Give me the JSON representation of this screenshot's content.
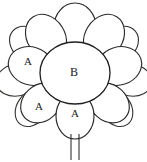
{
  "figure": {
    "kind": "flower-line-drawing",
    "background_color": "#ffffff",
    "line_color": "#2b2b2b",
    "width": 147,
    "height": 162,
    "core": {
      "label": "B",
      "cx": 75,
      "cy": 73,
      "rx": 35,
      "ry": 31
    },
    "labels": [
      {
        "id": "petal-label-left",
        "text": "A",
        "x": 28,
        "y": 62
      },
      {
        "id": "petal-label-lower-left",
        "text": "A",
        "x": 39,
        "y": 107
      },
      {
        "id": "petal-label-bottom",
        "text": "A",
        "x": 75,
        "y": 114
      },
      {
        "id": "core-label",
        "text": "B",
        "x": 74,
        "y": 73
      }
    ],
    "inner_petals": [
      {
        "id": "inner-petal-top",
        "cx": 75,
        "cy": 26,
        "rx": 21,
        "ry": 24,
        "rot": 0
      },
      {
        "id": "inner-petal-upper-left",
        "cx": 45,
        "cy": 35,
        "rx": 19,
        "ry": 24,
        "rot": -32
      },
      {
        "id": "inner-petal-upper-right",
        "cx": 105,
        "cy": 35,
        "rx": 19,
        "ry": 24,
        "rot": 32
      },
      {
        "id": "inner-petal-left",
        "cx": 30,
        "cy": 65,
        "rx": 19,
        "ry": 23,
        "rot": -72
      },
      {
        "id": "inner-petal-right",
        "cx": 120,
        "cy": 65,
        "rx": 19,
        "ry": 23,
        "rot": 72
      },
      {
        "id": "inner-petal-lower-left",
        "cx": 40,
        "cy": 104,
        "rx": 18,
        "ry": 22,
        "rot": -132
      },
      {
        "id": "inner-petal-lower-right",
        "cx": 110,
        "cy": 104,
        "rx": 18,
        "ry": 22,
        "rot": 132
      },
      {
        "id": "inner-petal-bottom",
        "cx": 75,
        "cy": 116,
        "rx": 19,
        "ry": 23,
        "rot": 180
      }
    ],
    "outer_petals": [
      {
        "id": "outer-petal-upper-left",
        "cx": 28,
        "cy": 42,
        "rx": 16,
        "ry": 20,
        "rot": -50
      },
      {
        "id": "outer-petal-upper-right",
        "cx": 122,
        "cy": 42,
        "rx": 16,
        "ry": 20,
        "rot": 50
      },
      {
        "id": "outer-petal-mid-left",
        "cx": 17,
        "cy": 80,
        "rx": 16,
        "ry": 21,
        "rot": -100
      },
      {
        "id": "outer-petal-mid-right",
        "cx": 133,
        "cy": 80,
        "rx": 16,
        "ry": 21,
        "rot": 100
      },
      {
        "id": "outer-petal-lower-left",
        "cx": 34,
        "cy": 110,
        "rx": 15,
        "ry": 20,
        "rot": -145
      },
      {
        "id": "outer-petal-lower-right",
        "cx": 116,
        "cy": 110,
        "rx": 15,
        "ry": 20,
        "rot": 145
      }
    ],
    "stem": {
      "left_x": 71,
      "right_x": 79,
      "top_y": 134,
      "bottom_y": 160
    }
  }
}
